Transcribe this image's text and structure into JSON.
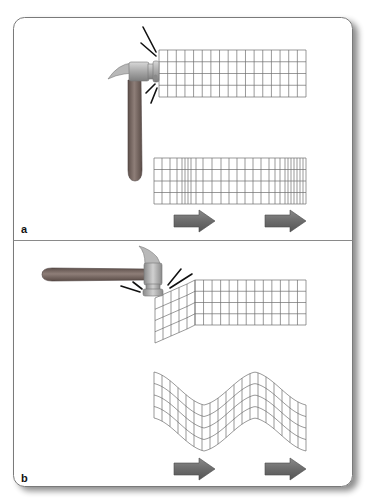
{
  "figure": {
    "type": "seismic wave diagram",
    "panels": [
      {
        "label": "a",
        "description": "Hammer strikes end of block horizontally producing compressional (P) wave",
        "hammer_orientation": "vertical-handle, striking horizontally",
        "top_grid": {
          "rows": 4,
          "cols": 17,
          "state": "undeformed"
        },
        "bottom_grid": {
          "rows": 4,
          "state": "compressed and dilated columns"
        },
        "arrows": [
          {
            "label": "propagation-direction"
          },
          {
            "label": "propagation-direction"
          }
        ]
      },
      {
        "label": "b",
        "description": "Hammer strikes top of block vertically producing shear (S) wave",
        "hammer_orientation": "horizontal-handle, striking downward",
        "top_grid": {
          "rows": 4,
          "cols": 17,
          "state": "sheared at left end"
        },
        "bottom_grid": {
          "rows": 4,
          "state": "zig-zag sheared"
        },
        "arrows": [
          {
            "label": "propagation-direction"
          },
          {
            "label": "propagation-direction"
          }
        ]
      }
    ]
  },
  "colors": {
    "panel_border": "#7a7a7a",
    "grid_line": "#6e6e6e",
    "arrow_fill": "#6f6f6f",
    "arrow_edge": "#4a4a4a",
    "hammer_handle": "#7a6a64",
    "hammer_head": "#b5b5b5",
    "impact_lines": "#111111"
  }
}
